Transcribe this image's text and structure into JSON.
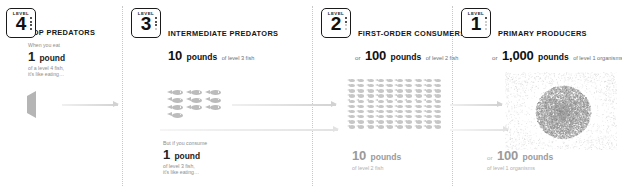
{
  "sections": [
    {
      "id": "level4",
      "badge": {
        "word": "LEVEL",
        "number": "4"
      },
      "heading": "TOP PREDATORS",
      "narrative_top": {
        "line1": "When you eat",
        "qty_number": "1",
        "qty_unit": "pound",
        "line3": "of a level 4 fish,",
        "line4": "it's like eating…"
      },
      "fish_count": 1
    },
    {
      "id": "level3",
      "badge": {
        "word": "LEVEL",
        "number": "3"
      },
      "heading": "INTERMEDIATE PREDATORS",
      "amount_top": {
        "prefix": "",
        "number": "10",
        "unit": "pounds",
        "suffix": "of level 3 fish"
      },
      "narrative_bottom": {
        "line1": "But if you consume",
        "qty_number": "1",
        "qty_unit": "pound",
        "line3": "of level 3 fish,",
        "line4": "it's like eating…"
      },
      "fish_count": 10
    },
    {
      "id": "level2",
      "badge": {
        "word": "LEVEL",
        "number": "2"
      },
      "heading": "FIRST-ORDER CONSUMERS",
      "amount_top": {
        "prefix": "or",
        "number": "100",
        "unit": "pounds",
        "suffix": "of level 2 fish"
      },
      "amount_bottom": {
        "prefix": "",
        "number": "10",
        "unit": "pounds",
        "suffix": "of level 2 fish"
      },
      "fish_count": 100
    },
    {
      "id": "level1",
      "badge": {
        "word": "LEVEL",
        "number": "1"
      },
      "heading": "PRIMARY PRODUCERS",
      "amount_top": {
        "prefix": "or",
        "number": "1,000",
        "unit": "pounds",
        "suffix": "of level 1 organisms"
      },
      "amount_bottom": {
        "prefix": "or",
        "number": "100",
        "unit": "pounds",
        "suffix": "of level 1 organisms"
      },
      "organism": "plankton-cloud"
    }
  ],
  "colors": {
    "text": "#161616",
    "muted": "#8d8d8d",
    "faint": "#b0b0b0",
    "fish": "#b9b9b9",
    "arrow": "#d2d2d2",
    "background": "#ffffff"
  }
}
